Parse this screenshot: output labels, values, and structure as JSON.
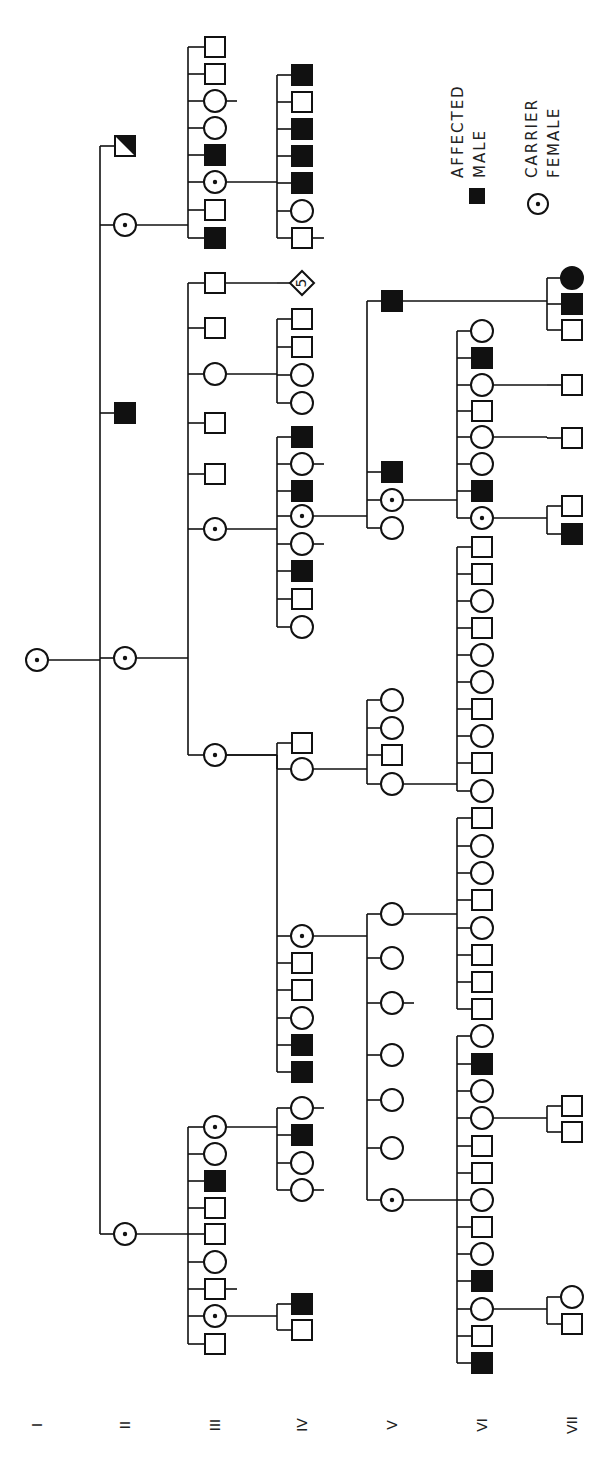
{
  "legend": {
    "affected_male": {
      "symbol": "filled-square",
      "line1": "AFFECTED",
      "line2": "MALE"
    },
    "carrier_female": {
      "symbol": "dotted-circle",
      "line1": "CARRIER",
      "line2": "FEMALE"
    }
  },
  "generation_labels": [
    {
      "label": "I",
      "x": 37
    },
    {
      "label": "II",
      "x": 125
    },
    {
      "label": "III",
      "x": 215
    },
    {
      "label": "IV",
      "x": 302
    },
    {
      "label": "V",
      "x": 392
    },
    {
      "label": "VI",
      "x": 482
    },
    {
      "label": "VII",
      "x": 572
    }
  ],
  "families": [
    {
      "parent": {
        "x": 37,
        "y": 660
      },
      "bracket_x": 100,
      "children": [
        {
          "x": 125,
          "y": 225,
          "type": "carrier"
        },
        {
          "x": 125,
          "y": 413,
          "type": "affected"
        },
        {
          "x": 125,
          "y": 658,
          "type": "carrier"
        },
        {
          "x": 125,
          "y": 1234,
          "type": "carrier"
        },
        {
          "x": 125,
          "y": 146,
          "type": "half"
        }
      ]
    },
    {
      "parent": {
        "x": 125,
        "y": 225
      },
      "bracket_x": 188,
      "children": [
        {
          "x": 215,
          "y": 47,
          "type": "male"
        },
        {
          "x": 215,
          "y": 74,
          "type": "male"
        },
        {
          "x": 215,
          "y": 101,
          "type": "female",
          "tick": true
        },
        {
          "x": 215,
          "y": 128,
          "type": "female"
        },
        {
          "x": 215,
          "y": 155,
          "type": "affected"
        },
        {
          "x": 215,
          "y": 182,
          "type": "carrier"
        },
        {
          "x": 215,
          "y": 210,
          "type": "male"
        },
        {
          "x": 215,
          "y": 238,
          "type": "affected"
        }
      ]
    },
    {
      "parent": {
        "x": 215,
        "y": 182
      },
      "bracket_x": 242,
      "children": [
        {
          "x": 265,
          "y": 182
        }
      ],
      "direct": true
    },
    {
      "parent": {
        "x": 242,
        "y": 182
      },
      "bracket_x": 242,
      "children": [
        {
          "x": 265,
          "y": 75
        },
        {
          "x": 265,
          "y": 238
        }
      ],
      "hidden": true
    },
    {
      "parent": {
        "x": 215,
        "y": 182
      },
      "bracket_x": 277,
      "children": [
        {
          "x": 302,
          "y": 75,
          "type": "affected"
        },
        {
          "x": 302,
          "y": 102,
          "type": "male"
        },
        {
          "x": 302,
          "y": 129,
          "type": "affected"
        },
        {
          "x": 302,
          "y": 156,
          "type": "affected"
        },
        {
          "x": 302,
          "y": 183,
          "type": "affected"
        },
        {
          "x": 302,
          "y": 211,
          "type": "female"
        },
        {
          "x": 302,
          "y": 238,
          "type": "male",
          "tick": true
        }
      ]
    },
    {
      "parent": {
        "x": 125,
        "y": 658
      },
      "bracket_x": 188,
      "children": [
        {
          "x": 215,
          "y": 283,
          "type": "male"
        },
        {
          "x": 215,
          "y": 328,
          "type": "male"
        },
        {
          "x": 215,
          "y": 374,
          "type": "female"
        },
        {
          "x": 215,
          "y": 423,
          "type": "male"
        },
        {
          "x": 215,
          "y": 474,
          "type": "male"
        },
        {
          "x": 215,
          "y": 529,
          "type": "carrier"
        },
        {
          "x": 215,
          "y": 755,
          "type": "carrier"
        }
      ]
    },
    {
      "parent": {
        "x": 215,
        "y": 283
      },
      "bracket_x": 277,
      "children": [
        {
          "x": 302,
          "y": 283,
          "type": "diamond",
          "text": "5"
        }
      ]
    },
    {
      "parent": {
        "x": 215,
        "y": 374
      },
      "bracket_x": 277,
      "children": [
        {
          "x": 302,
          "y": 319,
          "type": "male"
        },
        {
          "x": 302,
          "y": 347,
          "type": "male"
        },
        {
          "x": 302,
          "y": 375,
          "type": "female"
        },
        {
          "x": 302,
          "y": 403,
          "type": "female"
        }
      ]
    },
    {
      "parent": {
        "x": 215,
        "y": 529
      },
      "bracket_x": 277,
      "children": [
        {
          "x": 302,
          "y": 437,
          "type": "affected"
        },
        {
          "x": 302,
          "y": 464,
          "type": "female",
          "tick": true
        },
        {
          "x": 302,
          "y": 491,
          "type": "affected"
        },
        {
          "x": 302,
          "y": 516,
          "type": "carrier"
        },
        {
          "x": 302,
          "y": 544,
          "type": "female",
          "tick": true
        },
        {
          "x": 302,
          "y": 571,
          "type": "affected"
        },
        {
          "x": 302,
          "y": 599,
          "type": "male"
        },
        {
          "x": 302,
          "y": 627,
          "type": "female"
        }
      ]
    },
    {
      "parent": {
        "x": 302,
        "y": 516
      },
      "bracket_x": 367,
      "children": [
        {
          "x": 392,
          "y": 301,
          "type": "affected"
        },
        {
          "x": 392,
          "y": 472,
          "type": "affected"
        },
        {
          "x": 392,
          "y": 500,
          "type": "carrier"
        },
        {
          "x": 392,
          "y": 528,
          "type": "female"
        }
      ]
    },
    {
      "parent": {
        "x": 392,
        "y": 301
      },
      "bracket_x": 547,
      "children": [
        {
          "x": 572,
          "y": 278,
          "type": "affected_female"
        },
        {
          "x": 572,
          "y": 304,
          "type": "affected"
        },
        {
          "x": 572,
          "y": 330,
          "type": "male"
        }
      ]
    },
    {
      "parent": {
        "x": 392,
        "y": 500
      },
      "bracket_x": 457,
      "children": [
        {
          "x": 482,
          "y": 331,
          "type": "female"
        },
        {
          "x": 482,
          "y": 358,
          "type": "affected"
        },
        {
          "x": 482,
          "y": 385,
          "type": "female"
        },
        {
          "x": 482,
          "y": 411,
          "type": "male"
        },
        {
          "x": 482,
          "y": 437,
          "type": "female"
        },
        {
          "x": 482,
          "y": 464,
          "type": "female"
        },
        {
          "x": 482,
          "y": 491,
          "type": "affected"
        },
        {
          "x": 482,
          "y": 518,
          "type": "carrier"
        }
      ]
    },
    {
      "parent": {
        "x": 482,
        "y": 301
      },
      "bracket_x": 547,
      "children": [],
      "hidden": true
    },
    {
      "parent": {
        "x": 482,
        "y": 385
      },
      "bracket_x": 547,
      "children": [
        {
          "x": 572,
          "y": 385,
          "type": "male"
        }
      ]
    },
    {
      "parent": {
        "x": 482,
        "y": 437
      },
      "bracket_x": 547,
      "children": [
        {
          "x": 572,
          "y": 438,
          "type": "male"
        }
      ]
    },
    {
      "parent": {
        "x": 482,
        "y": 518
      },
      "bracket_x": 547,
      "children": [
        {
          "x": 572,
          "y": 506,
          "type": "male"
        },
        {
          "x": 572,
          "y": 534,
          "type": "affected"
        }
      ]
    },
    {
      "parent": {
        "x": 215,
        "y": 755
      },
      "bracket_x": 277,
      "children": [
        {
          "x": 302,
          "y": 743,
          "type": "male"
        },
        {
          "x": 302,
          "y": 769,
          "type": "female"
        }
      ]
    },
    {
      "parent": {
        "x": 302,
        "y": 769
      },
      "bracket_x": 367,
      "children": [
        {
          "x": 392,
          "y": 700,
          "type": "female"
        },
        {
          "x": 392,
          "y": 728,
          "type": "female"
        },
        {
          "x": 392,
          "y": 755,
          "type": "male"
        },
        {
          "x": 392,
          "y": 784,
          "type": "female"
        }
      ]
    },
    {
      "parent": {
        "x": 392,
        "y": 784
      },
      "bracket_x": 457,
      "children": [
        {
          "x": 482,
          "y": 547,
          "type": "male"
        },
        {
          "x": 482,
          "y": 574,
          "type": "male"
        },
        {
          "x": 482,
          "y": 601,
          "type": "female"
        },
        {
          "x": 482,
          "y": 628,
          "type": "male"
        },
        {
          "x": 482,
          "y": 655,
          "type": "female"
        },
        {
          "x": 482,
          "y": 682,
          "type": "female"
        },
        {
          "x": 482,
          "y": 709,
          "type": "male"
        },
        {
          "x": 482,
          "y": 736,
          "type": "female"
        },
        {
          "x": 482,
          "y": 763,
          "type": "male"
        },
        {
          "x": 482,
          "y": 791,
          "type": "female"
        }
      ]
    },
    {
      "parent": {
        "x": 215,
        "y": 755
      },
      "bracket_x": 277,
      "children": [
        {
          "x": 302,
          "y": 936,
          "type": "carrier"
        },
        {
          "x": 302,
          "y": 963,
          "type": "male"
        },
        {
          "x": 302,
          "y": 990,
          "type": "male"
        },
        {
          "x": 302,
          "y": 1018,
          "type": "female"
        },
        {
          "x": 302,
          "y": 1045,
          "type": "affected"
        },
        {
          "x": 302,
          "y": 1072,
          "type": "affected"
        }
      ]
    },
    {
      "parent": {
        "x": 302,
        "y": 936
      },
      "bracket_x": 367,
      "children": [
        {
          "x": 392,
          "y": 914,
          "type": "female"
        },
        {
          "x": 392,
          "y": 958,
          "type": "female"
        },
        {
          "x": 392,
          "y": 1003,
          "type": "female",
          "tick": true
        },
        {
          "x": 392,
          "y": 1055,
          "type": "female"
        },
        {
          "x": 392,
          "y": 1100,
          "type": "female"
        },
        {
          "x": 392,
          "y": 1148,
          "type": "female"
        },
        {
          "x": 392,
          "y": 1200,
          "type": "carrier"
        }
      ]
    },
    {
      "parent": {
        "x": 392,
        "y": 914
      },
      "bracket_x": 457,
      "children": [
        {
          "x": 482,
          "y": 818,
          "type": "male"
        },
        {
          "x": 482,
          "y": 846,
          "type": "female"
        },
        {
          "x": 482,
          "y": 873,
          "type": "female"
        },
        {
          "x": 482,
          "y": 900,
          "type": "male"
        },
        {
          "x": 482,
          "y": 928,
          "type": "female"
        },
        {
          "x": 482,
          "y": 955,
          "type": "male"
        },
        {
          "x": 482,
          "y": 982,
          "type": "male"
        },
        {
          "x": 482,
          "y": 1009,
          "type": "male"
        }
      ]
    },
    {
      "parent": {
        "x": 392,
        "y": 1200
      },
      "bracket_x": 457,
      "children": [
        {
          "x": 482,
          "y": 1036,
          "type": "female"
        },
        {
          "x": 482,
          "y": 1064,
          "type": "affected"
        },
        {
          "x": 482,
          "y": 1091,
          "type": "female"
        },
        {
          "x": 482,
          "y": 1118,
          "type": "female"
        },
        {
          "x": 482,
          "y": 1146,
          "type": "male"
        },
        {
          "x": 482,
          "y": 1173,
          "type": "male"
        },
        {
          "x": 482,
          "y": 1200,
          "type": "female"
        },
        {
          "x": 482,
          "y": 1227,
          "type": "male"
        },
        {
          "x": 482,
          "y": 1254,
          "type": "female"
        },
        {
          "x": 482,
          "y": 1281,
          "type": "affected"
        },
        {
          "x": 482,
          "y": 1309,
          "type": "female"
        },
        {
          "x": 482,
          "y": 1336,
          "type": "male"
        },
        {
          "x": 482,
          "y": 1363,
          "type": "affected"
        }
      ]
    },
    {
      "parent": {
        "x": 482,
        "y": 1118
      },
      "bracket_x": 547,
      "children": [
        {
          "x": 572,
          "y": 1106,
          "type": "male"
        },
        {
          "x": 572,
          "y": 1132,
          "type": "male"
        }
      ]
    },
    {
      "parent": {
        "x": 482,
        "y": 1309
      },
      "bracket_x": 547,
      "children": [
        {
          "x": 572,
          "y": 1297,
          "type": "female"
        },
        {
          "x": 572,
          "y": 1324,
          "type": "male"
        }
      ]
    },
    {
      "parent": {
        "x": 125,
        "y": 1234
      },
      "bracket_x": 188,
      "children": [
        {
          "x": 215,
          "y": 1127,
          "type": "carrier"
        },
        {
          "x": 215,
          "y": 1154,
          "type": "female"
        },
        {
          "x": 215,
          "y": 1181,
          "type": "affected"
        },
        {
          "x": 215,
          "y": 1208,
          "type": "male"
        },
        {
          "x": 215,
          "y": 1234,
          "type": "male"
        },
        {
          "x": 215,
          "y": 1262,
          "type": "female"
        },
        {
          "x": 215,
          "y": 1289,
          "type": "male",
          "tick": true
        },
        {
          "x": 215,
          "y": 1316,
          "type": "carrier"
        },
        {
          "x": 215,
          "y": 1344,
          "type": "male"
        }
      ]
    },
    {
      "parent": {
        "x": 215,
        "y": 1127
      },
      "bracket_x": 277,
      "children": [
        {
          "x": 302,
          "y": 1108,
          "type": "female",
          "tick": true
        },
        {
          "x": 302,
          "y": 1135,
          "type": "affected"
        },
        {
          "x": 302,
          "y": 1163,
          "type": "female"
        },
        {
          "x": 302,
          "y": 1190,
          "type": "female",
          "tick": true
        }
      ]
    },
    {
      "parent": {
        "x": 215,
        "y": 1316
      },
      "bracket_x": 277,
      "children": [
        {
          "x": 302,
          "y": 1304,
          "type": "affected"
        },
        {
          "x": 302,
          "y": 1330,
          "type": "male"
        }
      ]
    }
  ],
  "proband": {
    "x": 37,
    "y": 660,
    "type": "carrier"
  }
}
